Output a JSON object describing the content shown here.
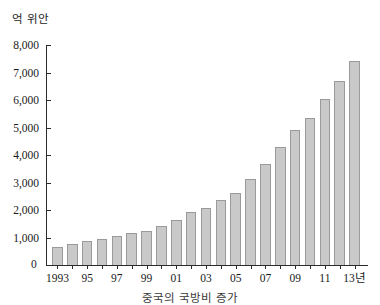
{
  "chart_data": {
    "type": "bar",
    "title": "",
    "caption": "중국의 국방비 증가",
    "unit_label": "억 위안",
    "xlabel": "",
    "ylabel": "억 위안",
    "ylim": [
      0,
      8000
    ],
    "ytick_step": 1000,
    "grid": false,
    "legend": null,
    "year_suffix": "년",
    "categories": [
      "1993",
      "1994",
      "1995",
      "1996",
      "1997",
      "1998",
      "1999",
      "2000",
      "2001",
      "2002",
      "2003",
      "2004",
      "2005",
      "2006",
      "2007",
      "2008",
      "2009",
      "2010",
      "2011",
      "2012",
      "2013"
    ],
    "tick_labels": [
      "1993",
      "",
      "95",
      "",
      "97",
      "",
      "99",
      "",
      "01",
      "",
      "03",
      "",
      "05",
      "",
      "07",
      "",
      "09",
      "",
      "11",
      "",
      "13년"
    ],
    "ytick_labels": [
      "0",
      "1,000",
      "2,000",
      "3,000",
      "4,000",
      "5,000",
      "6,000",
      "7,000",
      "8,000"
    ],
    "ytick_values": [
      0,
      1000,
      2000,
      3000,
      4000,
      5000,
      6000,
      7000,
      8000
    ],
    "values": [
      650,
      780,
      860,
      960,
      1060,
      1170,
      1250,
      1410,
      1620,
      1910,
      2070,
      2370,
      2620,
      3110,
      3680,
      4280,
      4900,
      5350,
      6050,
      6680,
      7410
    ],
    "bar_color": "#c9c9c9",
    "bar_border_color": "#9a9a9a",
    "axis_color": "#2b2b2b"
  }
}
